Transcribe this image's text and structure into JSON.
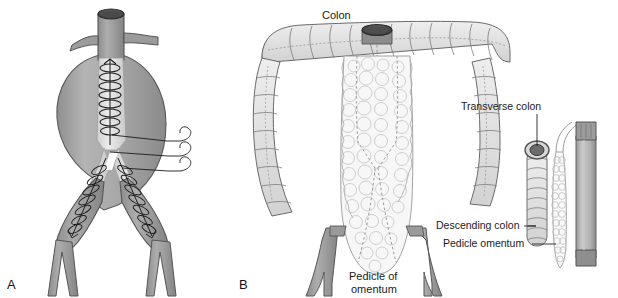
{
  "figure": {
    "background_color": "#ffffff",
    "width": 618,
    "height": 298,
    "type": "medical-illustration"
  },
  "palette": {
    "vessel_gray": "#9a9a9a",
    "vessel_gray_dark": "#808080",
    "vessel_outline": "#4a4a4a",
    "aneurysm_sac": "#b0b0b0",
    "graft_light": "#dcdcdc",
    "stent_wire": "#1e1e1e",
    "lumen_dark": "#555555",
    "colon_fill": "#e2e2e2",
    "colon_outline": "#6b6b6b",
    "omentum_fill": "#f5f5f5",
    "omentum_outline": "#9b9b9b",
    "label_text": "#1a1a1a",
    "leader_line": "#222222"
  },
  "panels": [
    {
      "id": "panel-a",
      "letter": "A",
      "title": "Aortic bifurcated stent graft in abdominal aortic aneurysm",
      "annotation_lines": 3
    },
    {
      "id": "panel-b",
      "letter": "B",
      "title": "Colon with pedicled omental flap"
    }
  ],
  "labels": {
    "panel_a_letter": "A",
    "panel_b_letter": "B",
    "colon": "Colon",
    "pedicle_of_omentum_line1": "Pedicle of",
    "pedicle_of_omentum_line2": "omentum",
    "transverse_colon": "Transverse colon",
    "descending_colon": "Descending colon",
    "pedicle_omentum": "Pedicle omentum"
  },
  "inset": {
    "id": "inset-diagram",
    "description": "Detail of transverse colon segment with pedicle omentum alongside instrument",
    "parts": [
      "transverse colon stump",
      "descending colon segment",
      "pedicle omentum strip",
      "gray cylindrical conduit"
    ]
  }
}
